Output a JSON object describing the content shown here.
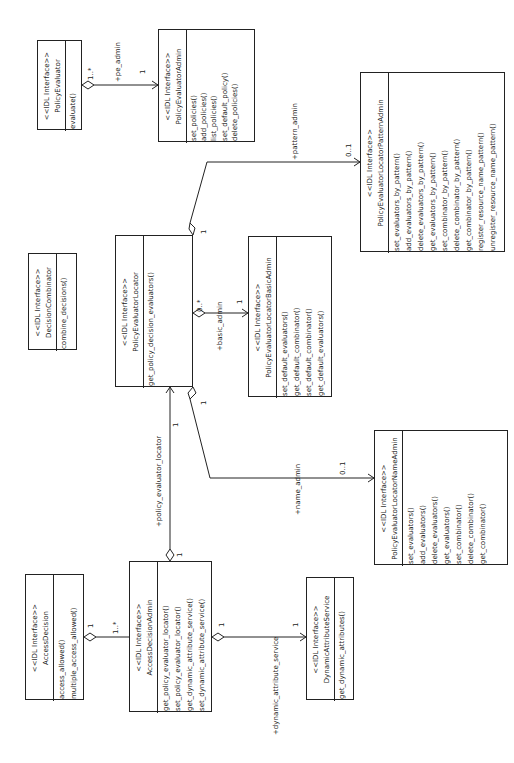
{
  "diagram": {
    "type": "UML class diagram (rotated 90° counter-clockwise)",
    "stereotype": "<<IDL Interface>>",
    "classes": {
      "policy_evaluator": {
        "stereotype": "<<IDL Interface>>",
        "name": "PolicyEvaluator",
        "operations": [
          "evaluate()"
        ]
      },
      "policy_evaluator_admin": {
        "stereotype": "<<IDL Interface>>",
        "name": "PolicyEvaluatorAdmin",
        "operations": [
          "set_policies()",
          "add_policies()",
          "list_policies()",
          "set_default_policy()",
          "delete_policies()"
        ]
      },
      "pattern_admin": {
        "stereotype": "<<IDL Interface>>",
        "name": "PolicyEvaluatorLocatorPatternAdmin",
        "operations": [
          "set_evaluators_by_pattern()",
          "add_evaluators_by_pattern()",
          "delete_evaluators_by_pattern()",
          "get_evaluators_by_pattern()",
          "set_combinator_by_pattern()",
          "delete_combinator_by_pattern()",
          "get_combinator_by_pattern()",
          "register_resource_name_pattern()",
          "unregister_resource_name_pattern()"
        ]
      },
      "decision_combinator": {
        "stereotype": "<<IDL Interface>>",
        "name": "DecisionCombinator",
        "operations": [
          "combine_decisions()"
        ]
      },
      "policy_evaluator_locator": {
        "stereotype": "<<IDL Interface>>",
        "name": "PolicyEvaluatorLocator",
        "operations": [
          "get_policy_decision_evaluators()"
        ]
      },
      "basic_admin": {
        "stereotype": "<<IDL Interface>>",
        "name": "PolicyEvaluatorLocatorBasicAdmin",
        "operations": [
          "set_default_evaluators()",
          "get_default_combinator()",
          "set_default_combinator()",
          "get_default_evaluators()"
        ]
      },
      "name_admin": {
        "stereotype": "<<IDL Interface>>",
        "name": "PolicyEvaluatorLocatorNameAdmin",
        "operations": [
          "set_evaluators()",
          "add_evaluators()",
          "delete_evaluators()",
          "get_evaluators()",
          "set_combinator()",
          "delete_combinator()",
          "get_combinator()"
        ]
      },
      "access_decision": {
        "stereotype": "<<IDL Interface>>",
        "name": "AccessDecision",
        "operations": [
          "access_allowed()",
          "multiple_access_allowed()"
        ]
      },
      "access_decision_admin": {
        "stereotype": "<<IDL Interface>>",
        "name": "AccessDecisionAdmin",
        "operations": [
          "get_policy_evaluator_locator()",
          "set_policy_evaluator_locator()",
          "get_dynamic_attribute_service()",
          "set_dynamic_attribute_service()"
        ]
      },
      "dynamic_attribute_service": {
        "stereotype": "<<IDL Interface>>",
        "name": "DynamicAttributeService",
        "operations": [
          "get_dynamic_attributes()"
        ]
      }
    },
    "associations": [
      {
        "from": "PolicyEvaluator",
        "to": "PolicyEvaluatorAdmin",
        "role": "+pe_admin",
        "from_mult": "1..*",
        "to_mult": "1"
      },
      {
        "from": "PolicyEvaluatorLocator",
        "to": "PolicyEvaluatorLocatorPatternAdmin",
        "role": "+pattern_admin",
        "from_mult": "1",
        "to_mult": "0..1"
      },
      {
        "from": "PolicyEvaluatorLocator",
        "to": "PolicyEvaluatorLocatorBasicAdmin",
        "role": "+basic_admin",
        "from_mult": "0..*",
        "to_mult": "1"
      },
      {
        "from": "PolicyEvaluatorLocator",
        "to": "PolicyEvaluatorLocatorNameAdmin",
        "role": "+name_admin",
        "from_mult": "1",
        "to_mult": "0..1"
      },
      {
        "from": "AccessDecisionAdmin",
        "to": "PolicyEvaluatorLocator",
        "role": "+policy_evaluator_locator",
        "from_mult": "1",
        "to_mult": "1"
      },
      {
        "from": "AccessDecision",
        "to": "AccessDecisionAdmin",
        "role": "",
        "from_mult": "1",
        "to_mult": "1..*"
      },
      {
        "from": "AccessDecisionAdmin",
        "to": "DynamicAttributeService",
        "role": "+dynamic_attribute_service",
        "from_mult": "1",
        "to_mult": "1"
      }
    ],
    "labels": {
      "pe_admin": "+pe_admin",
      "pattern_admin": "+pattern_admin",
      "basic_admin": "+basic_admin",
      "name_admin": "+name_admin",
      "policy_evaluator_locator": "+policy_evaluator_locator",
      "dynamic_attribute_service": "+dynamic_attribute_service",
      "m_1": "1",
      "m_1_many": "1..*",
      "m_0_1": "0..1",
      "m_0_many": "0..*"
    }
  }
}
